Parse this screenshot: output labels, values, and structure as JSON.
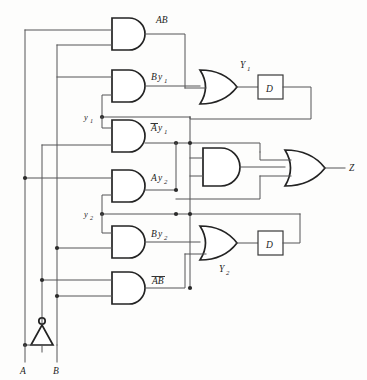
{
  "diagram": {
    "type": "logic-circuit-schematic",
    "inputs": [
      {
        "name": "A",
        "label": "A"
      },
      {
        "name": "B",
        "label": "B"
      }
    ],
    "outputs": [
      {
        "name": "Z",
        "label": "Z"
      }
    ],
    "state_variables": [
      {
        "name": "y1",
        "label": "y",
        "sub": "1"
      },
      {
        "name": "y2",
        "label": "y",
        "sub": "2"
      }
    ],
    "next_state": [
      {
        "name": "Y1",
        "label": "Y",
        "sub": "1"
      },
      {
        "name": "Y2",
        "label": "Y",
        "sub": "2"
      }
    ],
    "delay_elements": [
      {
        "name": "D1",
        "label": "D"
      },
      {
        "name": "D2",
        "label": "D"
      }
    ],
    "and_gates": [
      {
        "name": "and-AB",
        "label_main": "AB",
        "label_sub": "",
        "overbar": "none",
        "y": 18
      },
      {
        "name": "and-By1",
        "label_main": "B",
        "label_sub": "1",
        "label_mid": "y",
        "overbar": "none",
        "y": 70
      },
      {
        "name": "and-notA-y1",
        "label_main": "A",
        "label_sub": "1",
        "label_mid": "y",
        "overbar": "first",
        "y": 120
      },
      {
        "name": "and-A-y2",
        "label_main": "A",
        "label_sub": "2",
        "label_mid": "y",
        "overbar": "none",
        "y": 170
      },
      {
        "name": "and-B-y2",
        "label_main": "B",
        "label_sub": "2",
        "label_mid": "y",
        "overbar": "none",
        "y": 226
      },
      {
        "name": "and-notA-notB",
        "label_main": "AB",
        "label_sub": "",
        "overbar": "both",
        "y": 272
      }
    ],
    "or_gates": [
      {
        "name": "or-Y1",
        "output_label": "Y",
        "output_sub": "1"
      },
      {
        "name": "or-Y2",
        "output_label": "Y",
        "output_sub": "2"
      },
      {
        "name": "or-Z",
        "output_label": "Z",
        "output_sub": ""
      }
    ],
    "middle_and_gate": {
      "name": "and-middle",
      "label": ""
    },
    "labels": {
      "ab": "AB",
      "by1_b": "B",
      "by1_y": "y",
      "by1_sub": "1",
      "nay1_a": "A",
      "nay1_y": "y",
      "nay1_sub": "1",
      "ay2_a": "A",
      "ay2_y": "y",
      "ay2_sub": "2",
      "by2_b": "B",
      "by2_y": "y",
      "by2_sub": "2",
      "nab": "AB",
      "y1_small": "y",
      "y1_small_sub": "1",
      "y2_small": "y",
      "y2_small_sub": "2",
      "Y1_big": "Y",
      "Y1_big_sub": "1",
      "Y2_big": "Y",
      "Y2_big_sub": "2",
      "D_upper": "D",
      "D_lower": "D",
      "A_in": "A",
      "B_in": "B",
      "Z_out": "Z"
    },
    "colors": {
      "wire": "#555456",
      "gate_outline": "#232323",
      "background": "#fdfdfc",
      "text": "#1d1d1d"
    }
  }
}
